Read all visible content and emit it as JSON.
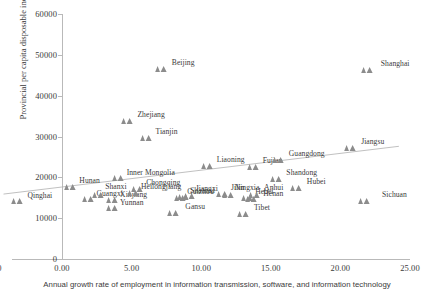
{
  "chart_data": {
    "type": "scatter",
    "title": "",
    "xlabel": "Annual growth rate of employment in information transmission, software, and information technology",
    "ylabel": "Provincial per capita disposable income in 2015 (RMB)",
    "xlim": [
      -5.0,
      25.0
    ],
    "ylim": [
      0,
      60000
    ],
    "xticks": [
      "-5.00",
      "0.00",
      "5.00",
      "10.00",
      "15.00",
      "20.00",
      "25.00"
    ],
    "xtick_values": [
      -5,
      0,
      5,
      10,
      15,
      20,
      25
    ],
    "yticks": [
      "0",
      "10000",
      "20000",
      "30000",
      "40000",
      "50000",
      "60000"
    ],
    "ytick_values": [
      0,
      10000,
      20000,
      30000,
      40000,
      50000,
      60000
    ],
    "grid": false,
    "legend": "none",
    "marker": "triangle",
    "marker_color": "#8c8c8c",
    "trendline": {
      "visible": true,
      "color": "#b0b0b0",
      "x_start": -4.2,
      "y_start": 15900,
      "x_end": 24.2,
      "y_end": 27600
    },
    "points": [
      {
        "name": "Qinghai",
        "x": -3.2,
        "y": 16000,
        "label_dx": 10,
        "label_dy": 7
      },
      {
        "name": "Guangxi",
        "x": 1.9,
        "y": 16300,
        "label_dx": 8,
        "label_dy": 7
      },
      {
        "name": "Hunan",
        "x": 0.6,
        "y": 19300,
        "label_dx": 9,
        "label_dy": 6
      },
      {
        "name": "Shanxi",
        "x": 2.6,
        "y": 17400,
        "label_dx": 7,
        "label_dy": 4
      },
      {
        "name": "Xinjiang",
        "x": 3.6,
        "y": 16100,
        "label_dx": 8,
        "label_dy": 7
      },
      {
        "name": "Yunnan",
        "x": 3.6,
        "y": 14300,
        "label_dx": 8,
        "label_dy": 7
      },
      {
        "name": "Inner Mongolia",
        "x": 4.0,
        "y": 21500,
        "label_dx": 9,
        "label_dy": 7
      },
      {
        "name": "Chongqing",
        "x": 5.4,
        "y": 18900,
        "label_dx": 9,
        "label_dy": 6
      },
      {
        "name": "Heilongjiang",
        "x": 5.1,
        "y": 17800,
        "label_dx": 8,
        "label_dy": 6
      },
      {
        "name": "Zhejiang",
        "x": 4.7,
        "y": 35400,
        "label_dx": 10,
        "label_dy": 6
      },
      {
        "name": "Tianjin",
        "x": 6.0,
        "y": 31300,
        "label_dx": 10,
        "label_dy": 6
      },
      {
        "name": "Beijing",
        "x": 7.1,
        "y": 48200,
        "label_dx": 11,
        "label_dy": 6
      },
      {
        "name": "Gansu",
        "x": 8.0,
        "y": 12900,
        "label_dx": 12,
        "label_dy": 6
      },
      {
        "name": "Guizhou",
        "x": 8.5,
        "y": 16700,
        "label_dx": 7,
        "label_dy": 6
      },
      {
        "name": "Jiangxi",
        "x": 9.1,
        "y": 17200,
        "label_dx": 7,
        "label_dy": 5
      },
      {
        "name": "Shaanxi",
        "x": 8.7,
        "y": 16900,
        "label_dx": 7,
        "label_dy": 6
      },
      {
        "name": "Liaoning",
        "x": 10.4,
        "y": 24500,
        "label_dx": 10,
        "label_dy": 6
      },
      {
        "name": "Jilin",
        "x": 11.5,
        "y": 17600,
        "label_dx": 9,
        "label_dy": 6
      },
      {
        "name": "Ningxia",
        "x": 11.9,
        "y": 17400,
        "label_dx": 7,
        "label_dy": 5
      },
      {
        "name": "Tibet",
        "x": 13.0,
        "y": 12700,
        "label_dx": 11,
        "label_dy": 6
      },
      {
        "name": "Hebei",
        "x": 13.3,
        "y": 16600,
        "label_dx": 8,
        "label_dy": 6
      },
      {
        "name": "Anhui",
        "x": 13.8,
        "y": 17300,
        "label_dx": 10,
        "label_dy": 5
      },
      {
        "name": "Henan",
        "x": 13.6,
        "y": 16300,
        "label_dx": 12,
        "label_dy": 7
      },
      {
        "name": "Fujian",
        "x": 13.7,
        "y": 24300,
        "label_dx": 10,
        "label_dy": 6
      },
      {
        "name": "Shandong",
        "x": 15.4,
        "y": 21300,
        "label_dx": 10,
        "label_dy": 6
      },
      {
        "name": "Guangdong",
        "x": 15.5,
        "y": 26000,
        "label_dx": 11,
        "label_dy": 6
      },
      {
        "name": "Hubei",
        "x": 16.8,
        "y": 19200,
        "label_dx": 11,
        "label_dy": 6
      },
      {
        "name": "Jiangsu",
        "x": 20.7,
        "y": 29000,
        "label_dx": 11,
        "label_dy": 6
      },
      {
        "name": "Sichuan",
        "x": 21.7,
        "y": 15800,
        "label_dx": 18,
        "label_dy": 6
      },
      {
        "name": "Shanghai",
        "x": 21.9,
        "y": 48100,
        "label_dx": 14,
        "label_dy": 6
      }
    ]
  }
}
